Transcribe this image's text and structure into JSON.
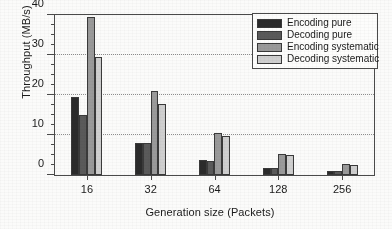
{
  "chart_data": {
    "type": "bar",
    "title": "",
    "xlabel": "Generation size (Packets)",
    "ylabel": "Throughput (MB/s)",
    "categories": [
      "16",
      "32",
      "64",
      "128",
      "256"
    ],
    "series": [
      {
        "name": "Encoding pure",
        "color": "#2b2b2b",
        "values": [
          19.5,
          8.1,
          3.7,
          1.8,
          1.0
        ]
      },
      {
        "name": "Decoding pure",
        "color": "#5a5a5a",
        "values": [
          15.0,
          7.9,
          3.6,
          1.7,
          0.9
        ]
      },
      {
        "name": "Encoding systematic",
        "color": "#9a9a9a",
        "values": [
          39.5,
          21.0,
          10.5,
          5.3,
          2.7
        ]
      },
      {
        "name": "Decoding systematic",
        "color": "#cfcfcf",
        "values": [
          29.5,
          17.7,
          9.7,
          5.0,
          2.5
        ]
      }
    ],
    "ylim": [
      0,
      40
    ],
    "ymajor_ticks": [
      0,
      10,
      20,
      30,
      40
    ],
    "ytick_labels": [
      "0",
      "10",
      "20",
      "30",
      "40"
    ],
    "yminor_step": 2.5,
    "grid": "y-major-dotted",
    "legend_position": "top-right"
  },
  "legend": {
    "items": [
      {
        "label": "Encoding pure"
      },
      {
        "label": "Decoding pure"
      },
      {
        "label": "Encoding systematic"
      },
      {
        "label": "Decoding systematic"
      }
    ]
  }
}
